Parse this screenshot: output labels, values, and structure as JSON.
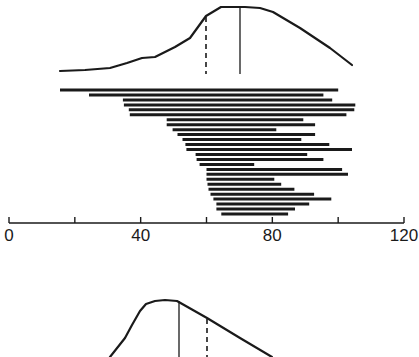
{
  "chart_data": {
    "type": "line",
    "title": "",
    "xlabel": "",
    "ylabel": "",
    "xlim": [
      0,
      120
    ],
    "x_ticks": [
      0,
      20,
      40,
      60,
      80,
      100,
      120
    ],
    "x_tick_labels": [
      "0",
      "",
      "40",
      "",
      "80",
      "",
      "120"
    ],
    "grid": false,
    "legend": null,
    "top_curve": {
      "x": [
        15.5,
        30.6,
        40.4,
        44.3,
        50.3,
        54.9,
        59.7,
        64.3,
        71.6,
        80.0,
        88.2,
        97.3,
        104.0
      ],
      "relative_height": [
        0.0,
        0.05,
        0.2,
        0.22,
        0.38,
        0.52,
        0.86,
        1.0,
        1.0,
        0.92,
        0.67,
        0.36,
        0.09
      ],
      "solid_marker_x": 70.0,
      "dashed_marker_x": 60.0
    },
    "range_bars": {
      "ranges": [
        [
          15.5,
          100.0
        ],
        [
          24.3,
          95.5
        ],
        [
          34.6,
          98.2
        ],
        [
          34.9,
          105.2
        ],
        [
          36.4,
          104.9
        ],
        [
          36.7,
          102.5
        ],
        [
          47.9,
          89.4
        ],
        [
          47.9,
          93.0
        ],
        [
          49.7,
          81.2
        ],
        [
          51.2,
          93.0
        ],
        [
          52.7,
          88.8
        ],
        [
          53.6,
          97.3
        ],
        [
          53.9,
          104.2
        ],
        [
          56.7,
          90.6
        ],
        [
          57.0,
          95.5
        ],
        [
          57.9,
          74.5
        ],
        [
          60.0,
          101.2
        ],
        [
          60.0,
          103.0
        ],
        [
          60.0,
          80.6
        ],
        [
          60.3,
          82.7
        ],
        [
          60.6,
          86.7
        ],
        [
          61.2,
          92.7
        ],
        [
          62.1,
          97.9
        ],
        [
          63.0,
          91.2
        ],
        [
          63.0,
          86.9
        ],
        [
          64.5,
          84.8
        ]
      ]
    },
    "bottom_curve": {
      "x": [
        30.6,
        37.0,
        41.2,
        46.4,
        50.9,
        51.5,
        57.3,
        63.9,
        70.6,
        80.6
      ],
      "relative_height": [
        0.0,
        0.42,
        0.8,
        0.93,
        1.0,
        1.0,
        0.81,
        0.58,
        0.33,
        0.0
      ],
      "solid_marker_x": 51.5,
      "dashed_marker_x": 60.0,
      "note": "curve continues below visible image area"
    }
  },
  "axis": {
    "labels": [
      "0",
      "40",
      "80",
      "120"
    ]
  }
}
